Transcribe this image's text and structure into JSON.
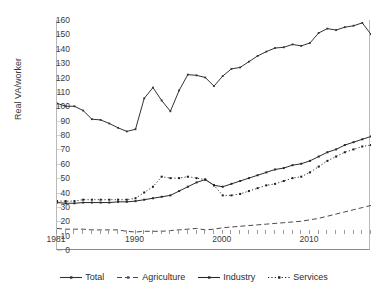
{
  "chart_data": {
    "type": "line",
    "title": "",
    "xlabel": "",
    "ylabel": "Real VA/worker",
    "ylim": [
      0,
      160
    ],
    "ytick_step": 10,
    "grid": true,
    "legend_position": "bottom",
    "xlim": [
      1981,
      2017
    ],
    "x": [
      1981,
      1982,
      1983,
      1984,
      1985,
      1986,
      1987,
      1988,
      1989,
      1990,
      1991,
      1992,
      1993,
      1994,
      1995,
      1996,
      1997,
      1998,
      1999,
      2000,
      2001,
      2002,
      2003,
      2004,
      2005,
      2006,
      2007,
      2008,
      2009,
      2010,
      2011,
      2012,
      2013,
      2014,
      2015,
      2016,
      2017
    ],
    "xticks": [
      1981,
      1982,
      1983,
      1984,
      1985,
      1986,
      1987,
      1988,
      1989,
      1990,
      1991,
      1992,
      1993,
      1994,
      1995,
      1996,
      1997,
      1998,
      1999,
      2000,
      2001,
      2002,
      2003,
      2004,
      2005,
      2006,
      2007,
      2008,
      2009,
      2010,
      2011,
      2012,
      2013,
      2014,
      2015,
      2016,
      2017
    ],
    "xtick_labels": [
      {
        "value": 1981,
        "label": "1981"
      },
      {
        "value": 1990,
        "label": "1990"
      },
      {
        "value": 2000,
        "label": "2000"
      },
      {
        "value": 2010,
        "label": "2010"
      }
    ],
    "ytick_labels": [
      "0",
      "10",
      "20",
      "30",
      "40",
      "50",
      "60",
      "70",
      "80",
      "90",
      "100",
      "110",
      "120",
      "130",
      "140",
      "150",
      "160"
    ],
    "series": [
      {
        "name": "Total",
        "style": "solid",
        "marker": "diamond",
        "color": "#333333",
        "values": [
          102,
          100,
          100,
          97,
          91,
          90.5,
          88,
          85,
          82.5,
          84,
          105.5,
          113,
          104,
          96.5,
          111,
          122,
          121.5,
          120,
          114,
          121,
          126,
          127,
          131,
          135,
          138,
          140.5,
          141,
          143,
          142,
          144,
          151,
          154,
          153,
          155,
          156,
          158,
          150
        ]
      },
      {
        "name": "Agriculture",
        "style": "dashed",
        "marker": "dash",
        "color": "#4a4a4a",
        "values": [
          15,
          14.5,
          14.5,
          14.5,
          14,
          14,
          14,
          14,
          13,
          12.5,
          13,
          13,
          13,
          13.5,
          14,
          14.5,
          15,
          14,
          14.5,
          15.5,
          16,
          16.5,
          17,
          17.5,
          18,
          18.5,
          19,
          19.5,
          20,
          21,
          22,
          23.5,
          25,
          26.5,
          28,
          29.5,
          31
        ]
      },
      {
        "name": "Industry",
        "style": "solid",
        "marker": "square",
        "color": "#2a2a2a",
        "values": [
          33,
          32.5,
          32.5,
          33,
          33,
          33,
          33,
          33.5,
          33.5,
          34,
          35,
          36,
          37,
          38,
          41,
          44,
          47,
          49,
          45,
          44,
          46,
          48,
          50,
          52,
          54,
          56,
          57,
          59,
          60,
          62,
          65,
          68,
          70,
          73,
          75,
          77,
          79
        ]
      },
      {
        "name": "Services",
        "style": "dotted",
        "marker": "square",
        "color": "#1e1e1e",
        "values": [
          34,
          34,
          34,
          35,
          35,
          35,
          35,
          35,
          35,
          36,
          40,
          44,
          51,
          50,
          50,
          51,
          50,
          49,
          45,
          38,
          38,
          39,
          41,
          43,
          45,
          46,
          48,
          50,
          51,
          54,
          58,
          62,
          65,
          68,
          70,
          72,
          73
        ]
      }
    ]
  },
  "legend": {
    "items": [
      {
        "label": "Total"
      },
      {
        "label": "Agriculture"
      },
      {
        "label": "Industry"
      },
      {
        "label": "Services"
      }
    ]
  },
  "axes": {
    "y_axis_title": "Real VA/worker"
  }
}
